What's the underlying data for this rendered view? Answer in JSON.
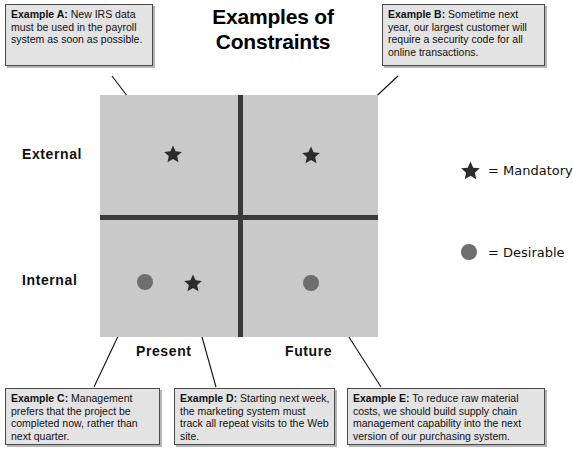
{
  "title": {
    "line1": "Examples of",
    "line2": "Constraints"
  },
  "callouts": [
    {
      "id": "example-a",
      "label": "Example A:",
      "text": " New IRS data must be used in the payroll system as soon as possible."
    },
    {
      "id": "example-b",
      "label": "Example B:",
      "text": " Sometime next year, our largest customer will require a security code for all online transactions."
    },
    {
      "id": "example-c",
      "label": "Example C:",
      "text": " Management prefers that the project be completed now, rather than next quarter."
    },
    {
      "id": "example-d",
      "label": "Example D:",
      "text": " Starting next week, the marketing system must track all repeat visits to the Web site."
    },
    {
      "id": "example-e",
      "label": "Example E:",
      "text": " To reduce raw material costs, we should build supply chain management capability into the next version of our purchasing system."
    }
  ],
  "axes": {
    "y_top": "External",
    "y_bottom": "Internal",
    "x_left": "Present",
    "x_right": "Future"
  },
  "legend": [
    {
      "marker": "star-icon",
      "text": "= Mandatory"
    },
    {
      "marker": "circle-icon",
      "text": "= Desirable"
    }
  ],
  "plot_markers": [
    {
      "id": "marker-a",
      "type": "star",
      "quadrant": "external-present",
      "example": "A"
    },
    {
      "id": "marker-b",
      "type": "star",
      "quadrant": "external-future",
      "example": "B"
    },
    {
      "id": "marker-c",
      "type": "circle",
      "quadrant": "internal-present",
      "example": "C"
    },
    {
      "id": "marker-d",
      "type": "star",
      "quadrant": "internal-present",
      "example": "D"
    },
    {
      "id": "marker-e",
      "type": "circle",
      "quadrant": "internal-future",
      "example": "E"
    }
  ],
  "colors": {
    "quadrant_fill": "#c9c9c9",
    "axis_line": "#3a3a3a",
    "callout_fill": "#e3e3e3",
    "callout_border": "#4a4a4a",
    "star": "#2b2b2b",
    "circle": "#6e6e6e"
  }
}
